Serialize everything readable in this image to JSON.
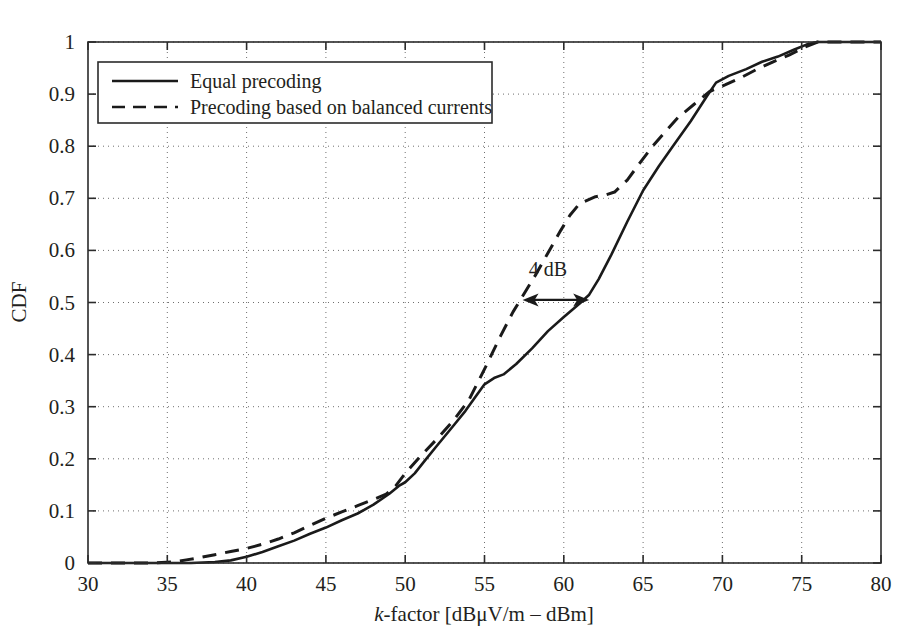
{
  "chart_data": {
    "type": "line",
    "title": "",
    "xlabel": "k-factor [dBμV/m – dBm]",
    "xlabel_italic_prefix": "k",
    "xlabel_rest": "-factor [dBμV/m – dBm]",
    "ylabel": "CDF",
    "xlim": [
      30,
      80
    ],
    "ylim": [
      0,
      1
    ],
    "xticks": [
      30,
      35,
      40,
      45,
      50,
      55,
      60,
      65,
      70,
      75,
      80
    ],
    "xtick_labels": [
      "30",
      "35",
      "40",
      "45",
      "50",
      "55",
      "60",
      "65",
      "70",
      "75",
      "80"
    ],
    "yticks": [
      0,
      0.1,
      0.2,
      0.3,
      0.4,
      0.5,
      0.6,
      0.7,
      0.8,
      0.9,
      1
    ],
    "ytick_labels": [
      "0",
      "0.1",
      "0.2",
      "0.3",
      "0.4",
      "0.5",
      "0.6",
      "0.7",
      "0.8",
      "0.9",
      "1"
    ],
    "grid": true,
    "grid_style": "dotted",
    "legend_position": "top-left",
    "line_color": "#1a1a1a",
    "series": [
      {
        "name": "Equal precoding",
        "style": "solid",
        "x": [
          30.0,
          34.0,
          36.5,
          38.0,
          39.0,
          40.0,
          41.0,
          42.0,
          43.0,
          44.0,
          45.0,
          46.0,
          47.0,
          48.0,
          49.0,
          49.6,
          50.0,
          50.6,
          51.2,
          52.0,
          53.0,
          53.8,
          54.5,
          55.0,
          55.6,
          56.2,
          57.0,
          58.0,
          59.0,
          60.0,
          61.0,
          61.6,
          62.2,
          63.0,
          64.0,
          65.0,
          66.0,
          67.0,
          68.0,
          69.0,
          69.6,
          70.4,
          71.5,
          72.5,
          73.5,
          74.5,
          75.3,
          76.0,
          78.0,
          80.0
        ],
        "y": [
          0.0,
          0.0,
          0.0,
          0.002,
          0.005,
          0.012,
          0.021,
          0.032,
          0.043,
          0.056,
          0.068,
          0.082,
          0.095,
          0.112,
          0.133,
          0.148,
          0.155,
          0.172,
          0.195,
          0.225,
          0.262,
          0.292,
          0.322,
          0.343,
          0.355,
          0.362,
          0.382,
          0.412,
          0.445,
          0.472,
          0.498,
          0.515,
          0.545,
          0.592,
          0.655,
          0.715,
          0.762,
          0.805,
          0.848,
          0.895,
          0.922,
          0.935,
          0.948,
          0.962,
          0.972,
          0.985,
          0.995,
          1.0,
          1.0,
          1.0
        ]
      },
      {
        "name": "Precoding based on balanced currents",
        "style": "dashed",
        "x": [
          30.0,
          34.0,
          35.4,
          36.2,
          37.0,
          38.0,
          39.0,
          40.0,
          41.0,
          42.0,
          43.0,
          44.0,
          45.0,
          46.0,
          47.0,
          48.0,
          48.8,
          49.4,
          50.0,
          51.0,
          52.0,
          53.0,
          54.0,
          55.0,
          56.0,
          56.8,
          57.4,
          58.2,
          59.0,
          59.8,
          60.4,
          61.0,
          62.0,
          62.6,
          63.2,
          64.0,
          64.8,
          65.6,
          66.4,
          67.2,
          68.2,
          69.2,
          70.2,
          71.2,
          72.2,
          73.2,
          74.2,
          75.2,
          76.0,
          78.0,
          80.0
        ],
        "y": [
          0.0,
          0.0,
          0.002,
          0.006,
          0.01,
          0.016,
          0.022,
          0.028,
          0.036,
          0.046,
          0.058,
          0.072,
          0.086,
          0.098,
          0.11,
          0.122,
          0.132,
          0.148,
          0.172,
          0.206,
          0.238,
          0.272,
          0.312,
          0.372,
          0.435,
          0.482,
          0.512,
          0.552,
          0.595,
          0.638,
          0.668,
          0.69,
          0.703,
          0.706,
          0.712,
          0.735,
          0.768,
          0.8,
          0.828,
          0.855,
          0.88,
          0.905,
          0.918,
          0.932,
          0.948,
          0.962,
          0.975,
          0.99,
          1.0,
          1.0,
          1.0
        ]
      }
    ],
    "annotations": [
      {
        "text": "4 dB",
        "type": "double-arrow",
        "x_start": 57.4,
        "x_end": 61.6,
        "y": 0.505,
        "label_x": 59.0,
        "label_y": 0.565
      }
    ]
  }
}
